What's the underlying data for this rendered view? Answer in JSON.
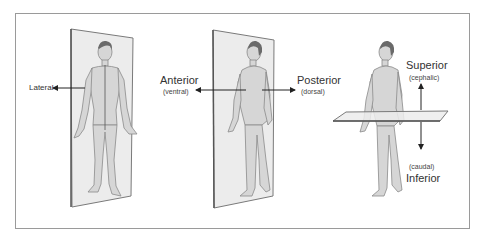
{
  "diagram": {
    "colors": {
      "frame": "#9a9a9a",
      "plane_fill": "#ececec",
      "plane_edge": "#7a7a7a",
      "skin_fill": "#d6d6d6",
      "skin_outline": "#8a8a8a",
      "hair": "#6a6a6a",
      "arrow": "#222222",
      "text": "#333333"
    },
    "panels": [
      {
        "id": "midsagittal",
        "view": "anterior (front) view, vertical sagittal plane",
        "labels": [
          {
            "text": "Lateral",
            "arrow": "left"
          }
        ]
      },
      {
        "id": "frontal",
        "view": "lateral/oblique view, vertical frontal plane",
        "labels": [
          {
            "text": "Anterior",
            "sub": "(ventral)",
            "arrow": "left"
          },
          {
            "text": "Posterior",
            "sub": "(dorsal)",
            "arrow": "right"
          }
        ]
      },
      {
        "id": "transverse",
        "view": "lateral view, horizontal transverse plane",
        "labels": [
          {
            "text": "Superior",
            "sub": "(cephalic)",
            "arrow": "up"
          },
          {
            "text": "Inferior",
            "sub": "(caudal)",
            "arrow": "down"
          }
        ]
      }
    ]
  },
  "labels": {
    "lateral": "Lateral",
    "anterior": "Anterior",
    "ventral": "(ventral)",
    "posterior": "Posterior",
    "dorsal": "(dorsal)",
    "superior": "Superior",
    "cephalic": "(cephalic)",
    "caudal": "(caudal)",
    "inferior": "Inferior"
  }
}
